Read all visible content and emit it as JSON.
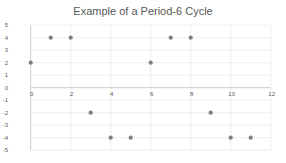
{
  "chart_data": {
    "type": "scatter",
    "title": "Example of a Period-6 Cycle",
    "xlabel": "",
    "ylabel": "",
    "xlim": [
      0,
      12
    ],
    "ylim": [
      -5,
      5
    ],
    "x_ticks": [
      0,
      2,
      4,
      6,
      8,
      10,
      12
    ],
    "y_ticks": [
      5,
      4,
      3,
      2,
      1,
      0,
      -1,
      -2,
      -3,
      -4,
      -5
    ],
    "grid": true,
    "legend": null,
    "marker_color": "#7f7f7f",
    "series": [
      {
        "name": "Series 1",
        "x": [
          0,
          1,
          2,
          3,
          4,
          5,
          6,
          7,
          8,
          9,
          10,
          11
        ],
        "y": [
          2,
          4,
          4,
          -2,
          -4,
          -4,
          2,
          4,
          4,
          -2,
          -4,
          -4
        ]
      }
    ]
  }
}
